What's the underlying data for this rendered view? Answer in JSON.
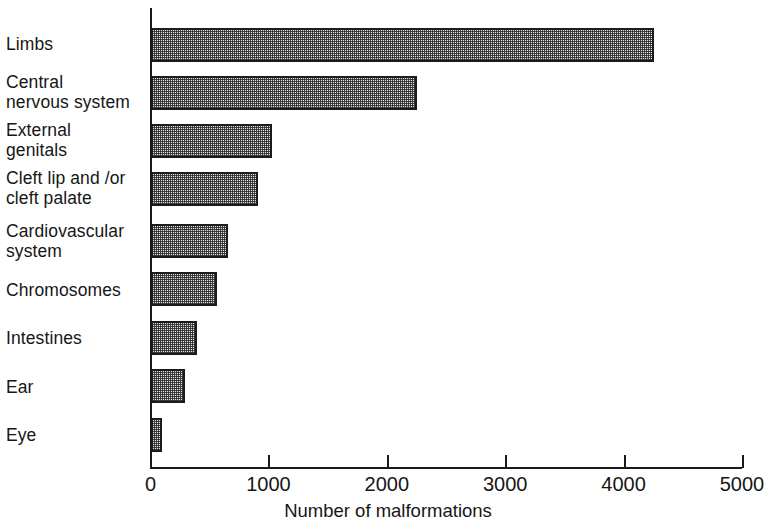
{
  "chart_data": {
    "type": "bar",
    "orientation": "horizontal",
    "title": "",
    "xlabel": "Number of malformations",
    "ylabel": "",
    "xlim": [
      0,
      5000
    ],
    "xticks": [
      0,
      1000,
      2000,
      3000,
      4000,
      5000
    ],
    "xtick_labels": [
      "0",
      "1000",
      "2000",
      "3000",
      "4000",
      "5000"
    ],
    "grid": false,
    "legend": false,
    "categories": [
      "Limbs",
      "Central\nnervous system",
      "External\ngenitals",
      "Cleft lip and /or\ncleft palate",
      "Cardiovascular\nsystem",
      "Chromosomes",
      "Intestines",
      "Ear",
      "Eye"
    ],
    "values": [
      4250,
      2250,
      1020,
      900,
      650,
      560,
      390,
      290,
      90
    ],
    "bar_fill": "#e4e4e4",
    "bar_edge": "#1b1b1b",
    "bar_pattern": "fine-checker-stipple"
  },
  "axis": {
    "x_title": "Number of malformations"
  },
  "style": {
    "axis_color": "#1a1a1a",
    "text_color": "#161616",
    "background": "#ffffff"
  }
}
